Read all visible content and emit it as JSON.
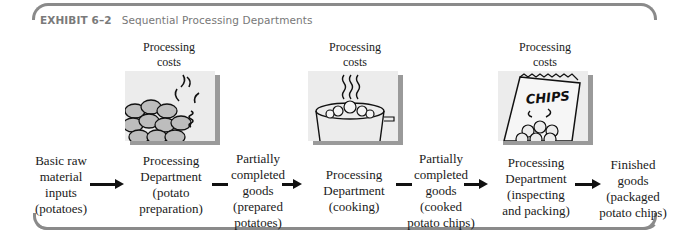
{
  "exhibit": {
    "number": "EXHIBIT 6–2",
    "title": "Sequential Processing Departments"
  },
  "processing_costs": [
    {
      "label_line1": "Processing",
      "label_line2": "costs",
      "image": "potatoes-being-washed-icon"
    },
    {
      "label_line1": "Processing",
      "label_line2": "costs",
      "image": "cooking-pot-icon"
    },
    {
      "label_line1": "Processing",
      "label_line2": "costs",
      "image": "chips-bag-icon"
    }
  ],
  "flow": [
    {
      "type": "input",
      "lines": [
        "Basic raw",
        "material",
        "inputs",
        "(potatoes)"
      ]
    },
    {
      "type": "department",
      "lines": [
        "Processing",
        "Department",
        "(potato",
        "preparation)"
      ]
    },
    {
      "type": "wip",
      "lines": [
        "Partially",
        "completed",
        "goods",
        "(prepared",
        "potatoes)"
      ]
    },
    {
      "type": "department",
      "lines": [
        "Processing",
        "Department",
        "(cooking)"
      ]
    },
    {
      "type": "wip",
      "lines": [
        "Partially",
        "completed",
        "goods",
        "(cooked",
        "potato chips)"
      ]
    },
    {
      "type": "department",
      "lines": [
        "Processing",
        "Department",
        "(inspecting",
        "and packing)"
      ]
    },
    {
      "type": "output",
      "lines": [
        "Finished",
        "goods",
        "(packaged",
        "potato chips)"
      ]
    }
  ],
  "chips_bag_text": "CHIPS",
  "colors": {
    "frame": "#8a8a8a",
    "image_bg": "#ececec",
    "image_shadow": "#9a9a9a",
    "title_text": "#777777"
  }
}
